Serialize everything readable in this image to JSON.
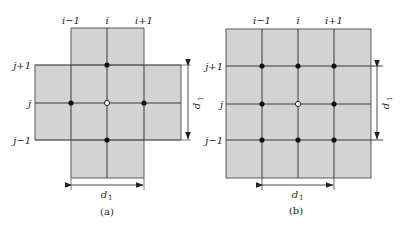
{
  "colors": {
    "fill": "#d3d3d3",
    "line": "#3a3a3a",
    "node": "#111111",
    "center_node": "#ffffff"
  },
  "diagram_a": {
    "caption": "(a)",
    "column_labels": [
      "i−1",
      "i",
      "i+1"
    ],
    "row_labels": [
      "j+1",
      "j",
      "j−1"
    ],
    "dimension_horizontal": {
      "symbol": "d",
      "subscript": "1"
    },
    "dimension_vertical": {
      "symbol": "d",
      "subscript": "1"
    },
    "shape": "cross",
    "nodes": "5-point stencil (center hollow, 4 neighbors filled)"
  },
  "diagram_b": {
    "caption": "(b)",
    "column_labels": [
      "i−1",
      "i",
      "i+1"
    ],
    "row_labels": [
      "j+1",
      "j",
      "j−1"
    ],
    "dimension_horizontal": {
      "symbol": "d",
      "subscript": "1"
    },
    "dimension_vertical": {
      "symbol": "d",
      "subscript": "1"
    },
    "shape": "square",
    "nodes": "9-point stencil (center hollow, 8 neighbors filled)"
  }
}
